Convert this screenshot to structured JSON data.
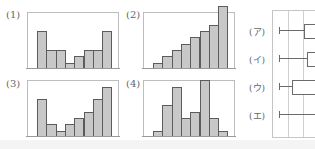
{
  "chart_data": [
    {
      "type": "bar",
      "id": "1",
      "title": "(1)",
      "categories": [
        "1",
        "2",
        "3",
        "4",
        "5",
        "6",
        "7",
        "8"
      ],
      "values": [
        6,
        3,
        3,
        1,
        2,
        3,
        3,
        6
      ],
      "xlabel": "",
      "ylabel": "",
      "grid": false
    },
    {
      "type": "bar",
      "id": "2",
      "title": "(2)",
      "categories": [
        "1",
        "2",
        "3",
        "4",
        "5",
        "6",
        "7",
        "8"
      ],
      "values": [
        1,
        2,
        3,
        4,
        5,
        6,
        7,
        10
      ],
      "xlabel": "",
      "ylabel": "",
      "grid": false
    },
    {
      "type": "bar",
      "id": "3",
      "title": "(3)",
      "categories": [
        "1",
        "2",
        "3",
        "4",
        "5",
        "6",
        "7",
        "8"
      ],
      "values": [
        6,
        2,
        1,
        2,
        3,
        4,
        6,
        8
      ],
      "xlabel": "",
      "ylabel": "",
      "grid": false
    },
    {
      "type": "bar",
      "id": "4",
      "title": "(4)",
      "categories": [
        "1",
        "2",
        "3",
        "4",
        "5",
        "6",
        "7",
        "8"
      ],
      "values": [
        1,
        5,
        8,
        3,
        4,
        9,
        3,
        1
      ],
      "xlabel": "",
      "ylabel": "",
      "grid": false
    },
    {
      "type": "boxplot",
      "id": "box",
      "title": "",
      "orientation": "horizontal",
      "categories": [
        "(ア)",
        "(イ)",
        "(ウ)",
        "(エ)"
      ],
      "note": "Box plots cropped at right edge; only left whisker and left box edge visible",
      "grid": true,
      "series": [
        {
          "name": "(ア)",
          "whisker_left_px": 279,
          "box_left_px": 304
        },
        {
          "name": "(イ)",
          "whisker_left_px": 279,
          "box_left_px": 307
        },
        {
          "name": "(ウ)",
          "whisker_left_px": 279,
          "box_left_px": 292
        },
        {
          "name": "(エ)",
          "whisker_left_px": 279,
          "box_left_px": null
        }
      ]
    }
  ],
  "labels": {
    "p1": "(1)",
    "p2": "(2)",
    "p3": "(3)",
    "p4": "(4)",
    "a": "(ア)",
    "i": "(イ)",
    "u": "(ウ)",
    "e": "(エ)"
  }
}
